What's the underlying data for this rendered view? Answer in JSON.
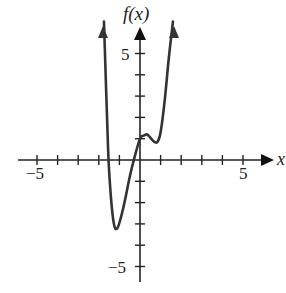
{
  "chart_data": {
    "type": "line",
    "title": "",
    "xlabel": "x",
    "ylabel": "f(x)",
    "xlim": [
      -5.5,
      6
    ],
    "ylim": [
      -5.5,
      6.5
    ],
    "x_ticks": [
      -5,
      -4,
      -3,
      -2,
      -1,
      1,
      2,
      3,
      4,
      5
    ],
    "y_ticks": [
      -5,
      -4,
      -3,
      -2,
      -1,
      1,
      2,
      3,
      4,
      5
    ],
    "tick_labels": {
      "x": [
        "-5",
        "5"
      ],
      "y": [
        "5",
        "-5"
      ]
    },
    "grid": false,
    "series": [
      {
        "name": "f(x)",
        "description": "Quartic-like curve with arrows at both ends pointing up",
        "x": [
          -1.75,
          -1.7,
          -1.6,
          -1.5,
          -1.3,
          -1.1,
          -0.8,
          -0.5,
          -0.3,
          0,
          0.2,
          0.35,
          0.5,
          0.7,
          0.85,
          1.0,
          1.2,
          1.4,
          1.6
        ],
        "y": [
          6.5,
          5.0,
          2.0,
          -0.5,
          -2.8,
          -3.2,
          -2.2,
          -0.8,
          0,
          1.0,
          1.15,
          1.2,
          1.05,
          0.85,
          0.85,
          1.3,
          2.8,
          4.8,
          6.5
        ]
      }
    ],
    "key_points": {
      "local_min_1": [
        -1.1,
        -3.2
      ],
      "local_max": [
        0.35,
        1.2
      ],
      "local_min_2": [
        0.8,
        0.85
      ],
      "x_intercepts": [
        -1.55,
        -0.3
      ],
      "y_intercept": [
        0,
        1.0
      ]
    }
  },
  "labels": {
    "y_axis": "f(x)",
    "x_axis": "x",
    "x_neg5": "−5",
    "x_pos5": "5",
    "y_pos5": "5",
    "y_neg5": "−5"
  }
}
